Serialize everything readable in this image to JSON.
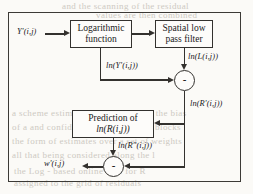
{
  "diagram": {
    "frame_color": "#3c3a36",
    "blocks": [
      {
        "id": "log",
        "line1": "Logarithmic",
        "line2": "function"
      },
      {
        "id": "lpf",
        "line1": "Spatial low",
        "line2": "pass filter"
      },
      {
        "id": "pred",
        "line1": "Prediction of",
        "line2": "ln(R(i,j))"
      }
    ],
    "junctions": [
      {
        "id": "sum1",
        "sign": "-"
      },
      {
        "id": "sum2",
        "sign": "-"
      }
    ],
    "signals": {
      "input": "Y'(i,j)",
      "log_out": "ln(Y'(i,j))",
      "lpf_out": "ln(L(i,j))",
      "sum1_out": "ln(R'(i,j))",
      "pred_out": "ln(R″(i,j))",
      "output": "w'(i,j)"
    }
  },
  "background_text": {
    "top1": "and the  scanning  of  the  residual",
    "top2": "values  are  then  combined",
    "mid1": "a  scheme  estimating  parameters  for  the  bias",
    "mid2": "of  a  and  confidence  values  of  these  blocks",
    "mid3": "the  form  of  estimates  over  a  set  of  weights",
    "mid4": "all  that  being  considered  along  the  l",
    "bot1": "the  Log  -  based  online  data  for  R",
    "bot2": "assigned    to  the  grid  of  residuals"
  }
}
